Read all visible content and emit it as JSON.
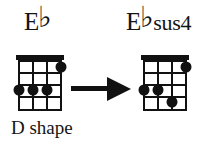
{
  "figure": {
    "type": "chord-chart-transition",
    "instrument": "4-string (ukulele)",
    "caption": "D shape",
    "background_color": "#ffffff",
    "ink_color": "#111111"
  },
  "left_chord": {
    "title_root": "E",
    "title_accidental": "♭",
    "title_suffix": "",
    "full_name": "E♭",
    "strings": 4,
    "frets": 4,
    "has_nut": true,
    "dots": [
      {
        "string": 4,
        "fret": 1,
        "label": ""
      },
      {
        "string": 1,
        "fret": 3,
        "label": ""
      },
      {
        "string": 2,
        "fret": 3,
        "label": ""
      },
      {
        "string": 3,
        "fret": 3,
        "label": ""
      }
    ]
  },
  "right_chord": {
    "title_root": "E",
    "title_accidental": "♭",
    "title_suffix": "sus4",
    "full_name": "E♭sus4",
    "strings": 4,
    "frets": 4,
    "has_nut": true,
    "dots": [
      {
        "string": 4,
        "fret": 1,
        "label": ""
      },
      {
        "string": 1,
        "fret": 3,
        "label": ""
      },
      {
        "string": 2,
        "fret": 3,
        "label": ""
      },
      {
        "string": 3,
        "fret": 4,
        "label": ""
      }
    ]
  },
  "arrow": {
    "direction": "right",
    "icon": "arrow-right-icon",
    "color": "#111111"
  }
}
